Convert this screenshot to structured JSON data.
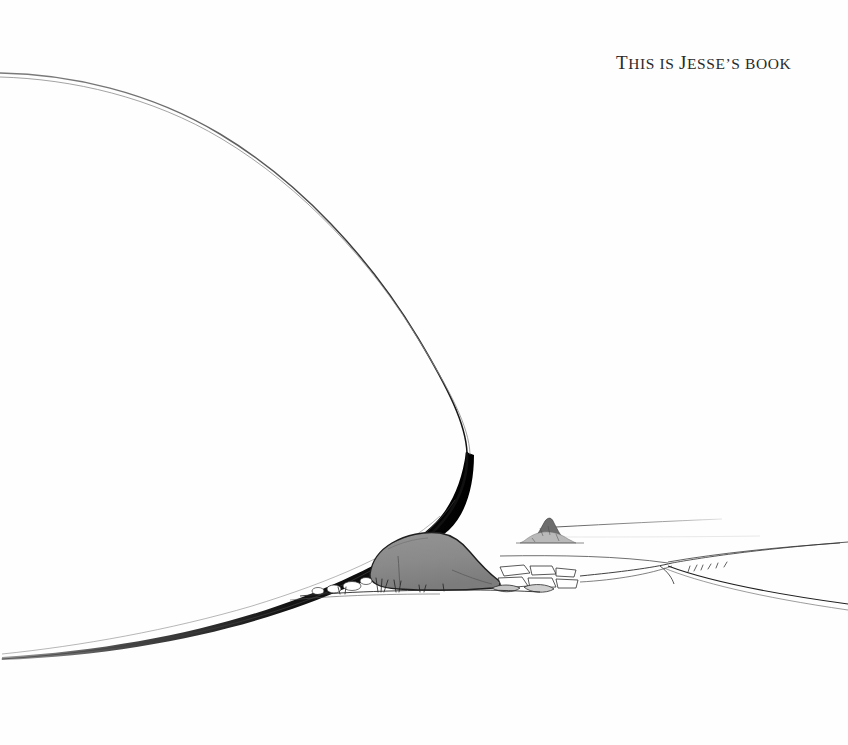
{
  "page": {
    "width": 848,
    "height": 745,
    "background_color": "#fefefe",
    "medium": "pen-and-ink line drawing"
  },
  "inscription": {
    "full_text": "THIS IS JESSE'S BOOK",
    "segments": {
      "t_cap": "T",
      "his_is": "HIS IS ",
      "j_cap": "J",
      "esses_book": "ESSE’S BOOK"
    },
    "color": "#2a2a2a"
  },
  "artwork": {
    "title": "landscape-line-drawing",
    "elements": [
      {
        "name": "great-curve",
        "label": "Large sweeping dune silhouette",
        "color": "#1a1a1a"
      },
      {
        "name": "boulder",
        "label": "Central gray boulder",
        "fill": "#8a8a8a",
        "stroke": "#1a1a1a"
      },
      {
        "name": "rock-cluster",
        "label": "Angular rocks right of boulder",
        "fill": "#ffffff",
        "stroke": "#2a2a2a"
      },
      {
        "name": "distant-outcrop",
        "label": "Small rocky outcrop on horizon",
        "color": "#555555"
      },
      {
        "name": "horizon-lines",
        "label": "Fine receding horizon lines",
        "color": "#666666"
      },
      {
        "name": "ground-pebbles",
        "label": "Pebbles and grass tufts at base",
        "color": "#333333"
      },
      {
        "name": "shore-fork",
        "label": "Diverging shoreline at right",
        "color": "#2a2a2a"
      }
    ],
    "palette": {
      "ink": "#1a1a1a",
      "boulder_gray": "#8a8a8a",
      "boulder_shadow": "#6e6e6e",
      "hairline": "#777777",
      "paper": "#fefefe"
    }
  }
}
